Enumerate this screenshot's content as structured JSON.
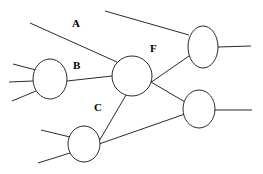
{
  "canvas": {
    "width": 263,
    "height": 174,
    "background": "#ffffff",
    "stroke_color": "#2b2b2b",
    "text_color": "#000000"
  },
  "diagram": {
    "type": "node-link-graph",
    "title": "",
    "node_fill": "#ffffff",
    "node_stroke": "#2b2b2b",
    "nodes": [
      {
        "id": "left",
        "name": "node-left",
        "cx": 50,
        "cy": 79,
        "rx": 17,
        "ry": 20,
        "label": ""
      },
      {
        "id": "center",
        "name": "node-center",
        "cx": 132,
        "cy": 76,
        "rx": 20,
        "ry": 20,
        "label": ""
      },
      {
        "id": "topright",
        "name": "node-top-right",
        "cx": 203,
        "cy": 47,
        "rx": 15,
        "ry": 21,
        "label": ""
      },
      {
        "id": "midright",
        "name": "node-mid-right",
        "cx": 199,
        "cy": 109,
        "rx": 16,
        "ry": 19,
        "label": ""
      },
      {
        "id": "bottom",
        "name": "node-bottom",
        "cx": 84,
        "cy": 144,
        "rx": 16,
        "ry": 18,
        "label": ""
      }
    ],
    "edges": [
      {
        "id": "e-A",
        "name": "edge-A",
        "from": "stub",
        "to": "center",
        "label": "A",
        "x1": 30,
        "y1": 23,
        "x2": 117,
        "y2": 62
      },
      {
        "id": "e-B",
        "name": "edge-B",
        "from": "left",
        "to": "center",
        "label": "B",
        "x1": 67,
        "y1": 81,
        "x2": 112,
        "y2": 76
      },
      {
        "id": "e-C",
        "name": "edge-C",
        "from": "center",
        "to": "bottom",
        "label": "C",
        "x1": 126,
        "y1": 95,
        "x2": 98,
        "y2": 143
      },
      {
        "id": "e-F",
        "name": "edge-F",
        "from": "center",
        "to": "topright",
        "label": "F",
        "x1": 150,
        "y1": 83,
        "x2": 189,
        "y2": 56
      },
      {
        "id": "e-cmr",
        "name": "edge-center-midright",
        "from": "center",
        "to": "midright",
        "label": "",
        "x1": 151,
        "y1": 82,
        "x2": 185,
        "y2": 102
      },
      {
        "id": "e-bmr",
        "name": "edge-bottom-midright",
        "from": "bottom",
        "to": "midright",
        "label": "",
        "x1": 99,
        "y1": 144,
        "x2": 185,
        "y2": 114
      },
      {
        "id": "e-trtop",
        "name": "edge-top-right-stub",
        "from": "stub",
        "to": "topright",
        "label": "",
        "x1": 105,
        "y1": 11,
        "x2": 189,
        "y2": 35
      }
    ],
    "stubs": [
      {
        "id": "s-left-up",
        "name": "stub-left-upper",
        "x1": 13,
        "y1": 64,
        "x2": 36,
        "y2": 70
      },
      {
        "id": "s-left-mid",
        "name": "stub-left-middle",
        "x1": 9,
        "y1": 82,
        "x2": 33,
        "y2": 81
      },
      {
        "id": "s-left-down",
        "name": "stub-left-lower",
        "x1": 12,
        "y1": 101,
        "x2": 36,
        "y2": 91
      },
      {
        "id": "s-tr-right",
        "name": "stub-top-right-right",
        "x1": 218,
        "y1": 47,
        "x2": 251,
        "y2": 46
      },
      {
        "id": "s-mr-right",
        "name": "stub-mid-right-right",
        "x1": 215,
        "y1": 110,
        "x2": 252,
        "y2": 110
      },
      {
        "id": "s-bot-up",
        "name": "stub-bottom-upper",
        "x1": 41,
        "y1": 130,
        "x2": 70,
        "y2": 137
      },
      {
        "id": "s-bot-down",
        "name": "stub-bottom-lower",
        "x1": 38,
        "y1": 163,
        "x2": 70,
        "y2": 153
      }
    ],
    "labels": [
      {
        "id": "lbl-A",
        "name": "edge-label-a",
        "text": "A",
        "x": 72,
        "y": 18
      },
      {
        "id": "lbl-B",
        "name": "edge-label-b",
        "text": "B",
        "x": 73,
        "y": 60
      },
      {
        "id": "lbl-C",
        "name": "edge-label-c",
        "text": "C",
        "x": 94,
        "y": 102
      },
      {
        "id": "lbl-F",
        "name": "edge-label-f",
        "text": "F",
        "x": 150,
        "y": 43
      }
    ]
  }
}
